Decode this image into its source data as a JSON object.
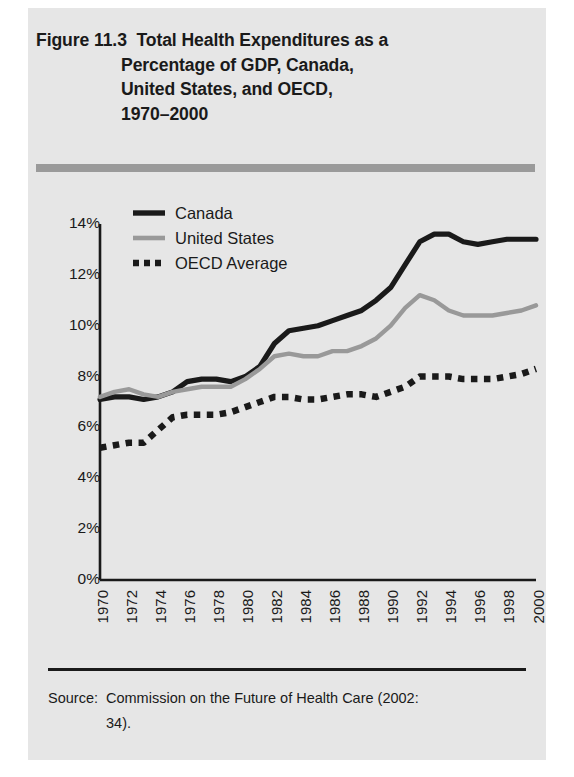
{
  "figure": {
    "title_lines": [
      "Figure 11.3  Total Health Expenditures as a",
      "Percentage of GDP, Canada,",
      "United States, and OECD,",
      "1970–2000"
    ],
    "source_label": "Source:",
    "source_text": "Commission on the Future of Health Care (2002:",
    "source_continuation": "34)."
  },
  "legend": {
    "items": [
      {
        "label": "Canada",
        "style": "solid",
        "color": "#1a1a1a"
      },
      {
        "label": "United States",
        "style": "solid",
        "color": "#999999"
      },
      {
        "label": "OECD Average",
        "style": "dotted",
        "color": "#1a1a1a"
      }
    ]
  },
  "colors": {
    "canada": "#1a1a1a",
    "united_states": "#999999",
    "oecd": "#1a1a1a",
    "axis": "#1a1a1a",
    "panel_background": "#e6e6e6",
    "title_rule": "#9a9a9a"
  },
  "chart_data": {
    "type": "line",
    "title": "Total Health Expenditures as a Percentage of GDP, Canada, United States, and OECD, 1970–2000",
    "xlabel": "",
    "ylabel": "",
    "grid": false,
    "legend_position": "top-left",
    "xlim": [
      1970,
      2000
    ],
    "ylim": [
      0,
      14
    ],
    "ytick_labels": [
      "0%",
      "2%",
      "4%",
      "6%",
      "8%",
      "10%",
      "12%",
      "14%"
    ],
    "ytick_values": [
      0,
      2,
      4,
      6,
      8,
      10,
      12,
      14
    ],
    "xtick_labels": [
      "1970",
      "1972",
      "1974",
      "1976",
      "1978",
      "1980",
      "1982",
      "1984",
      "1986",
      "1988",
      "1990",
      "1992",
      "1994",
      "1996",
      "1998",
      "2000"
    ],
    "xtick_values": [
      1970,
      1972,
      1974,
      1976,
      1978,
      1980,
      1982,
      1984,
      1986,
      1988,
      1990,
      1992,
      1994,
      1996,
      1998,
      2000
    ],
    "x": [
      1970,
      1971,
      1972,
      1973,
      1974,
      1975,
      1976,
      1977,
      1978,
      1979,
      1980,
      1981,
      1982,
      1983,
      1984,
      1985,
      1986,
      1987,
      1988,
      1989,
      1990,
      1991,
      1992,
      1993,
      1994,
      1995,
      1996,
      1997,
      1998,
      1999,
      2000
    ],
    "series": [
      {
        "name": "Canada",
        "style": "solid",
        "color": "#1a1a1a",
        "values": [
          7.1,
          7.2,
          7.2,
          7.1,
          7.2,
          7.4,
          7.8,
          7.9,
          7.9,
          7.8,
          8.0,
          8.4,
          9.3,
          9.8,
          9.9,
          10.0,
          10.2,
          10.4,
          10.6,
          11.0,
          11.5,
          12.4,
          13.3,
          13.6,
          13.6,
          13.3,
          13.2,
          13.3,
          13.4,
          13.4,
          13.4
        ],
        "minimum": 7.1,
        "maximum": 13.6,
        "first_value": 7.1,
        "last_value": 13.4
      },
      {
        "name": "United States",
        "style": "solid",
        "color": "#999999",
        "values": [
          7.2,
          7.4,
          7.5,
          7.3,
          7.2,
          7.4,
          7.5,
          7.6,
          7.6,
          7.6,
          7.9,
          8.3,
          8.8,
          8.9,
          8.8,
          8.8,
          9.0,
          9.0,
          9.2,
          9.5,
          10.0,
          10.7,
          11.2,
          11.0,
          10.6,
          10.4,
          10.4,
          10.4,
          10.5,
          10.6,
          10.8
        ],
        "minimum": 7.2,
        "maximum": 11.2,
        "first_value": 7.2,
        "last_value": 10.8
      },
      {
        "name": "OECD Average",
        "style": "dotted",
        "color": "#1a1a1a",
        "values": [
          5.2,
          5.3,
          5.4,
          5.4,
          5.9,
          6.4,
          6.5,
          6.5,
          6.5,
          6.6,
          6.8,
          7.0,
          7.2,
          7.2,
          7.1,
          7.1,
          7.2,
          7.3,
          7.3,
          7.2,
          7.4,
          7.6,
          8.0,
          8.0,
          8.0,
          7.9,
          7.9,
          7.9,
          8.0,
          8.1,
          8.3
        ],
        "minimum": 5.2,
        "maximum": 8.3,
        "first_value": 5.2,
        "last_value": 8.3
      }
    ]
  }
}
